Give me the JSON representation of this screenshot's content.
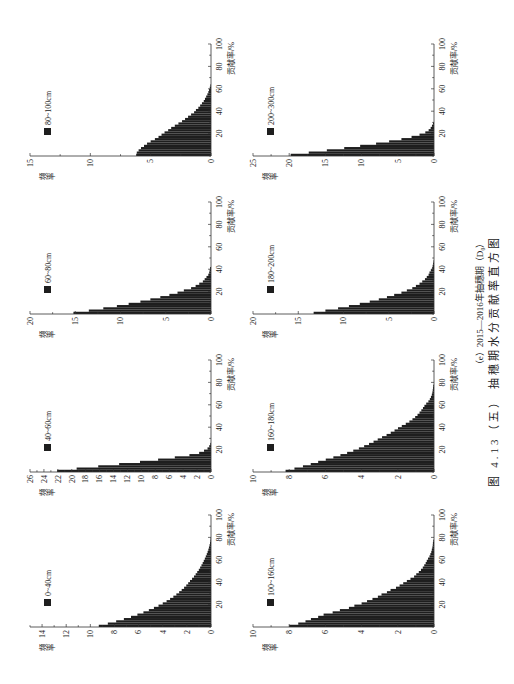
{
  "figure": {
    "subcaption": "（e）2015—2016年抽穗期（D₀）",
    "caption": "图 4.13（五） 抽穗期水分贡献率直方图"
  },
  "chart_data": [
    {
      "type": "bar",
      "title": "0~40cm",
      "legend": [
        "0~40cm"
      ],
      "legend_position": "top-left",
      "xlabel": "贡献率/%",
      "ylabel": "频率",
      "xlim": [
        0,
        100
      ],
      "ylim": [
        0,
        15
      ],
      "xticks": [
        20,
        40,
        60,
        80,
        100
      ],
      "x_minor_step": 10,
      "yticks": [
        0,
        2,
        4,
        6,
        8,
        10,
        12,
        14
      ],
      "y_minor_step": 1,
      "grid": false,
      "bin_width": 2,
      "color": "#1e1e1e",
      "values": [
        9.3,
        8.55,
        7.86,
        7.22,
        6.63,
        6.1,
        5.6,
        5.15,
        4.73,
        4.35,
        4.0,
        3.68,
        3.39,
        3.12,
        2.87,
        2.64,
        2.43,
        2.23,
        2.05,
        1.89,
        1.74,
        1.57,
        1.41,
        1.27,
        1.14,
        1.01,
        0.9,
        0.79,
        0.69,
        0.6,
        0.51,
        0.43,
        0.35,
        0.28,
        0.22,
        0.17,
        0.12,
        0.08,
        0.05,
        0.03
      ]
    },
    {
      "type": "bar",
      "title": "40~60cm",
      "legend": [
        "40~60cm"
      ],
      "legend_position": "top-left",
      "xlabel": "贡献率/%",
      "ylabel": "频率",
      "xlim": [
        0,
        100
      ],
      "ylim": [
        0,
        26
      ],
      "xticks": [
        20,
        40,
        60,
        80,
        100
      ],
      "x_minor_step": 10,
      "yticks": [
        0,
        2,
        4,
        6,
        8,
        10,
        12,
        14,
        16,
        18,
        20,
        22,
        24,
        26
      ],
      "y_minor_step": 1,
      "grid": false,
      "bin_width": 2,
      "color": "#1e1e1e",
      "values": [
        22.1,
        19.3,
        16.2,
        13.2,
        10.2,
        7.6,
        5.2,
        3.1,
        1.7,
        1.0,
        0.5,
        0.25,
        0.1
      ]
    },
    {
      "type": "bar",
      "title": "60~80cm",
      "legend": [
        "60~80cm"
      ],
      "legend_position": "top-left",
      "xlabel": "贡献率/%",
      "ylabel": "频率",
      "xlim": [
        0,
        100
      ],
      "ylim": [
        0,
        20
      ],
      "xticks": [
        20,
        40,
        60,
        80,
        100
      ],
      "x_minor_step": 10,
      "yticks": [
        0,
        5,
        10,
        15,
        20
      ],
      "y_minor_step": 2.5,
      "grid": false,
      "bin_width": 2,
      "color": "#1e1e1e",
      "values": [
        15.2,
        13.5,
        11.9,
        10.4,
        9.1,
        7.8,
        6.7,
        5.6,
        4.6,
        3.7,
        3.0,
        2.2,
        1.7,
        1.3,
        0.9,
        0.7,
        0.5,
        0.3,
        0.2,
        0.15,
        0.1
      ]
    },
    {
      "type": "bar",
      "title": "80~100cm",
      "legend": [
        "80~100cm"
      ],
      "legend_position": "top-left",
      "xlabel": "贡献率/%",
      "ylabel": "频率",
      "xlim": [
        0,
        100
      ],
      "ylim": [
        0,
        15
      ],
      "xticks": [
        20,
        40,
        60,
        80,
        100
      ],
      "x_minor_step": 10,
      "yticks": [
        0,
        5,
        10,
        15
      ],
      "y_minor_step": 2.5,
      "grid": false,
      "bin_width": 2,
      "color": "#1e1e1e",
      "values": [
        6.2,
        6.15,
        6.0,
        5.8,
        5.55,
        5.3,
        5.0,
        4.65,
        4.35,
        4.1,
        3.85,
        3.55,
        3.3,
        3.0,
        2.7,
        2.4,
        2.15,
        1.9,
        1.65,
        1.4,
        1.25,
        1.05,
        0.9,
        0.75,
        0.6,
        0.5,
        0.4,
        0.3,
        0.22,
        0.16,
        0.1,
        0.05
      ]
    },
    {
      "type": "bar",
      "title": "100~160cm",
      "legend": [
        "100~160cm"
      ],
      "legend_position": "top-left",
      "xlabel": "贡献率/%",
      "ylabel": "频率",
      "xlim": [
        0,
        100
      ],
      "ylim": [
        0,
        10
      ],
      "xticks": [
        20,
        40,
        60,
        80,
        100
      ],
      "x_minor_step": 10,
      "yticks": [
        0,
        2,
        4,
        6,
        8,
        10
      ],
      "y_minor_step": 1,
      "grid": false,
      "bin_width": 2,
      "color": "#1e1e1e",
      "values": [
        8.0,
        7.5,
        7.1,
        6.8,
        6.4,
        6.1,
        5.6,
        5.2,
        4.7,
        4.4,
        4.0,
        3.7,
        3.4,
        3.1,
        2.9,
        2.6,
        2.4,
        2.1,
        1.9,
        1.7,
        1.5,
        1.3,
        1.1,
        0.98,
        0.84,
        0.72,
        0.62,
        0.54,
        0.46,
        0.4,
        0.33,
        0.25,
        0.2,
        0.15,
        0.12,
        0.09,
        0.07,
        0.06,
        0.04
      ]
    },
    {
      "type": "bar",
      "title": "160~180cm",
      "legend": [
        "160~180cm"
      ],
      "legend_position": "top-left",
      "xlabel": "贡献率/%",
      "ylabel": "频率",
      "xlim": [
        0,
        100
      ],
      "ylim": [
        0,
        10
      ],
      "xticks": [
        20,
        40,
        60,
        80,
        100
      ],
      "x_minor_step": 10,
      "yticks": [
        0,
        2,
        4,
        6,
        8,
        10
      ],
      "y_minor_step": 1,
      "grid": false,
      "bin_width": 2,
      "color": "#1e1e1e",
      "values": [
        8.2,
        7.71,
        7.24,
        6.81,
        6.4,
        5.98,
        5.56,
        5.17,
        4.8,
        4.46,
        4.15,
        3.86,
        3.59,
        3.34,
        3.11,
        2.87,
        2.62,
        2.39,
        2.18,
        1.99,
        1.78,
        1.56,
        1.36,
        1.19,
        1.04,
        0.91,
        0.8,
        0.7,
        0.61,
        0.53,
        0.43,
        0.31,
        0.23,
        0.17,
        0.12,
        0.09,
        0.07,
        0.05,
        0.04
      ]
    },
    {
      "type": "bar",
      "title": "180~200cm",
      "legend": [
        "180~200cm"
      ],
      "legend_position": "top-left",
      "xlabel": "贡献率/%",
      "ylabel": "频率",
      "xlim": [
        0,
        100
      ],
      "ylim": [
        0,
        20
      ],
      "xticks": [
        20,
        40,
        60,
        80,
        100
      ],
      "x_minor_step": 10,
      "yticks": [
        0,
        5,
        10,
        15,
        20
      ],
      "y_minor_step": 2.5,
      "grid": false,
      "bin_width": 2,
      "color": "#1e1e1e",
      "values": [
        13.3,
        12.0,
        10.6,
        9.4,
        8.2,
        7.1,
        6.1,
        5.2,
        4.4,
        3.6,
        3.0,
        2.4,
        2.0,
        1.6,
        1.3,
        1.0,
        0.8,
        0.6,
        0.5,
        0.35,
        0.2,
        0.15,
        0.1,
        0.05
      ]
    },
    {
      "type": "bar",
      "title": "200~300cm",
      "legend": [
        "200~300cm"
      ],
      "legend_position": "top-left",
      "xlabel": "贡献率/%",
      "ylabel": "频率",
      "xlim": [
        0,
        100
      ],
      "ylim": [
        0,
        25
      ],
      "xticks": [
        20,
        40,
        60,
        80,
        100
      ],
      "x_minor_step": 10,
      "yticks": [
        0,
        5,
        10,
        15,
        20,
        25
      ],
      "y_minor_step": 2.5,
      "grid": false,
      "bin_width": 2,
      "color": "#1e1e1e",
      "values": [
        19.8,
        17.3,
        14.8,
        12.4,
        10.2,
        8.0,
        6.2,
        4.5,
        3.1,
        2.0,
        1.2,
        0.74,
        0.46,
        0.28,
        0.14
      ]
    }
  ]
}
